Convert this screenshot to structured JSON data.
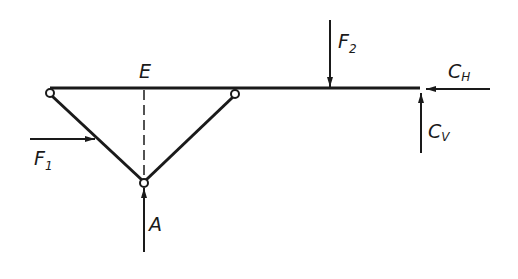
{
  "diagram": {
    "type": "truss-beam free body diagram",
    "colors": {
      "stroke": "#1a1a1a",
      "background": "#ffffff"
    },
    "labels": {
      "E": "E",
      "F1_main": "F",
      "F1_sub": "1",
      "F2_main": "F",
      "F2_sub": "2",
      "CH_main": "C",
      "CH_sub": "H",
      "CV_main": "C",
      "CV_sub": "V",
      "A": "A"
    },
    "members": [
      {
        "name": "beam",
        "from": [
          50,
          88
        ],
        "to": [
          420,
          88
        ]
      },
      {
        "name": "left-strut",
        "from": [
          50,
          93
        ],
        "to": [
          144,
          182
        ]
      },
      {
        "name": "right-strut",
        "from": [
          235,
          94
        ],
        "to": [
          144,
          182
        ]
      },
      {
        "name": "center-dashed-line",
        "from": [
          144,
          88
        ],
        "to": [
          144,
          182
        ]
      }
    ],
    "joints": [
      {
        "name": "left-pin",
        "at": [
          50,
          93
        ]
      },
      {
        "name": "right-pin",
        "at": [
          235,
          94
        ]
      },
      {
        "name": "bottom-pin",
        "at": [
          144,
          183
        ]
      }
    ],
    "forces": [
      {
        "name": "F1",
        "direction": "right",
        "from": [
          30,
          139
        ],
        "to": [
          95,
          139
        ]
      },
      {
        "name": "F2",
        "direction": "down",
        "from": [
          330,
          20
        ],
        "to": [
          330,
          88
        ]
      },
      {
        "name": "CH",
        "direction": "left",
        "from": [
          490,
          89
        ],
        "to": [
          426,
          89
        ]
      },
      {
        "name": "CV",
        "direction": "up",
        "from": [
          421,
          153
        ],
        "to": [
          421,
          93
        ]
      },
      {
        "name": "A",
        "direction": "up",
        "from": [
          144,
          252
        ],
        "to": [
          144,
          188
        ]
      }
    ]
  }
}
